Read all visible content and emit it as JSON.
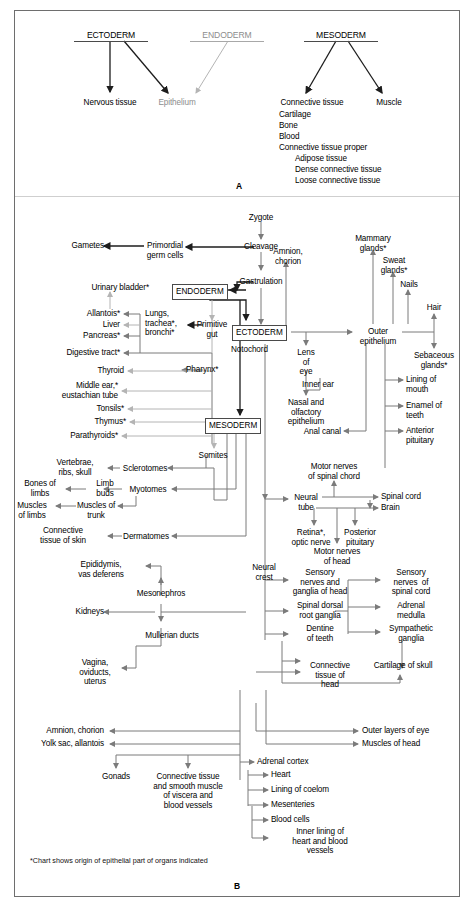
{
  "figure": {
    "panel_a_letter": "A",
    "panel_b_letter": "B",
    "footnote": "*Chart shows origin of epithelial part of organs indicated"
  },
  "panel_a": {
    "germ_layers": [
      {
        "label": "ECTODERM",
        "tone": "dark"
      },
      {
        "label": "ENDODERM",
        "tone": "light"
      },
      {
        "label": "MESODERM",
        "tone": "dark"
      }
    ],
    "derivatives": [
      {
        "label": "Nervous tissue",
        "tone": "dark"
      },
      {
        "label": "Epithelium",
        "tone": "light"
      },
      {
        "label": "Connective tissue",
        "tone": "dark"
      },
      {
        "label": "Muscle",
        "tone": "dark"
      }
    ],
    "connective_tissue_list": [
      {
        "label": "Cartilage",
        "indent": 0
      },
      {
        "label": "Bone",
        "indent": 0
      },
      {
        "label": "Blood",
        "indent": 0
      },
      {
        "label": "Connective tissue proper",
        "indent": 0
      },
      {
        "label": "Adipose tissue",
        "indent": 1
      },
      {
        "label": "Dense connective tissue",
        "indent": 1
      },
      {
        "label": "Loose connective tissue",
        "indent": 1
      }
    ]
  },
  "panel_b": {
    "stem": {
      "zygote": "Zygote",
      "cleavage": "Cleavage",
      "gastrulation": "Gastrulation",
      "primordial_germ_cells": "Primordial\ngerm cells",
      "gametes": "Gametes"
    },
    "germ_layer_boxes": {
      "endoderm": "ENDODERM",
      "ectoderm": "ECTODERM",
      "mesoderm": "MESODERM"
    },
    "endoderm_branch": {
      "primitive_gut": "Primitive\ngut",
      "notochord": "Notochord",
      "pharynx": "Pharynx*",
      "lungs_trachea_bronchi": "Lungs,\ntrachea*,\nbronchi*",
      "urinary_bladder": "Urinary bladder*",
      "gut_derivatives": [
        "Allantois*",
        "Liver",
        "Pancreas*",
        "Digestive tract*"
      ],
      "pharynx_derivatives": [
        "Thyroid",
        "Middle ear,*\neustachian tube",
        "Tonsils*",
        "Thymus*",
        "Parathyroids*"
      ]
    },
    "ectoderm_branch": {
      "amnion_chorion": "Amnion,\nchorion",
      "outer_epithelium": "Outer\nepithelium",
      "lens_of_eye": "Lens\nof\neye",
      "inner_ear": "Inner ear",
      "nasal_olfactory": "Nasal and\nolfactory\nepithelium",
      "anal_canal": "Anal canal",
      "skin_appendages": [
        "Mammary\nglands*",
        "Sweat\nglands*",
        "Nails",
        "Hair",
        "Sebaceous\nglands*"
      ],
      "oral_derivatives": [
        "Lining of\nmouth",
        "Enamel of\nteeth",
        "Anterior\npituitary"
      ]
    },
    "neural_branch": {
      "neural_tube": "Neural\ntube",
      "neural_crest": "Neural\ncrest",
      "motor_nerves_spinal": "Motor nerves\nof spinal chord",
      "spinal_cord": "Spinal cord",
      "brain": "Brain",
      "retina_optic": "Retina*,\noptic nerve",
      "posterior_pituitary": "Posterior\npituitary",
      "motor_nerves_head": "Motor nerves\nof head",
      "crest_derivatives_left": [
        "Sensory\nnerves and\nganglia of head",
        "Spinal dorsal\nroot ganglia",
        "Dentine\nof teeth"
      ],
      "crest_derivatives_right": [
        "Sensory\nnerves  of\nspinal cord",
        "Adrenal\nmedulla",
        "Sympathetic\nganglia"
      ],
      "connective_tissue_head": "Connective\ntissue of\nhead",
      "cartilage_of_skull": "Cartilage of skull"
    },
    "mesoderm_branch": {
      "somites": "Somites",
      "sclerotomes": "Sclerotomes",
      "myotomes": "Myotomes",
      "dermatomes": "Dermatomes",
      "limb_buds": "Limb\nbuds",
      "muscles_of_trunk": "Muscles of\ntrunk",
      "vertebrae_ribs_skull": "Vertebrae,\nribs, skull",
      "bones_of_limbs": "Bones of\nlimbs",
      "muscles_of_limbs": "Muscles\nof limbs",
      "connective_tissue_skin": "Connective\ntissue of skin",
      "mesonephros": "Mesonephros",
      "epididymis": "Epididymis,\nvas deferens",
      "kidneys": "Kidneys",
      "mullerian_ducts": "Mullerian ducts",
      "vagina_oviducts_uterus": "Vagina,\noviducts,\nuterus",
      "amnion_chorion": "Amnion, chorion",
      "yolk_sac_allantois": "Yolk sac, allantois",
      "outer_layers_of_eye": "Outer layers of eye",
      "muscles_of_head": "Muscles of head",
      "gonads": "Gonads",
      "connective_smooth_muscle": "Connective tissue\nand smooth muscle\nof viscera and\nblood vessels",
      "coelom_derivatives": [
        "Adrenal cortex",
        "Heart",
        "Lining of coelom",
        "Mesenteries",
        "Blood cells",
        "Inner lining of\nheart and blood\nvessels"
      ]
    }
  },
  "colors": {
    "line_gray": "#7b7b7b",
    "line_dark": "#1d1d1d",
    "line_light": "#b4b4b4",
    "text_light": "#8d8d8d",
    "frame": "#6e6e6e"
  }
}
